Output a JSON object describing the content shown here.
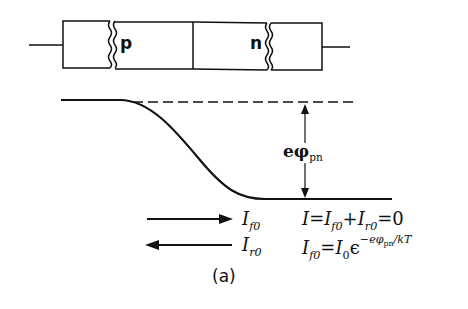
{
  "diagram": {
    "device": {
      "region_p_label": "p",
      "region_n_label": "n"
    },
    "energy_band": {
      "barrier_label_main": "eφ",
      "barrier_label_sub": "pn"
    },
    "currents": {
      "forward_label_main": "I",
      "forward_label_sub": "f0",
      "reverse_label_main": "I",
      "reverse_label_sub": "r0",
      "equation_1": {
        "lhs": "I",
        "eq": "=",
        "t1_main": "I",
        "t1_sub": "f0",
        "plus": "+",
        "t2_main": "I",
        "t2_sub": "r0",
        "rhs": "=0"
      },
      "equation_2": {
        "lhs_main": "I",
        "lhs_sub": "f0",
        "eq": "=",
        "i0_main": "I",
        "i0_sub": "0",
        "epsilon": "ϵ",
        "exp_prefix": "−eφ",
        "exp_sub": "pn",
        "exp_suffix": "/kT"
      }
    },
    "caption": "(a)",
    "colors": {
      "ink": "#111111",
      "background": "#ffffff"
    }
  }
}
